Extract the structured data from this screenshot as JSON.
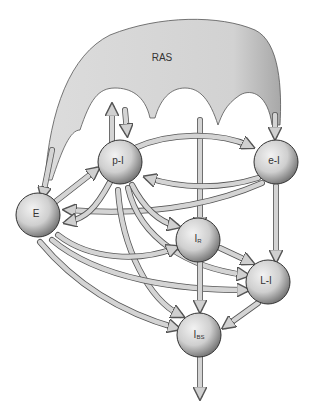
{
  "diagram": {
    "type": "network",
    "colors": {
      "fill": "#d6d6d6",
      "stroke": "#555555",
      "shade": "#8a8a8a",
      "background": "#ffffff"
    },
    "nodes": [
      {
        "id": "ras",
        "label": "RAS",
        "shape": "arch-blob"
      },
      {
        "id": "pI",
        "label": "p-I",
        "shape": "sphere"
      },
      {
        "id": "eI",
        "label": "e-I",
        "shape": "sphere"
      },
      {
        "id": "E",
        "label": "E",
        "shape": "sphere"
      },
      {
        "id": "IR",
        "label": "I",
        "sub": "R",
        "shape": "sphere"
      },
      {
        "id": "LI",
        "label": "L-I",
        "shape": "sphere"
      },
      {
        "id": "IBS",
        "label": "I",
        "sub": "BS",
        "shape": "sphere"
      }
    ],
    "edges": [
      {
        "from": "ras",
        "to": "E"
      },
      {
        "from": "ras",
        "to": "pI"
      },
      {
        "from": "ras",
        "to": "IR"
      },
      {
        "from": "ras",
        "to": "eI"
      },
      {
        "from": "pI",
        "to": "up-output"
      },
      {
        "from": "pI",
        "to": "eI"
      },
      {
        "from": "eI",
        "to": "pI"
      },
      {
        "from": "eI",
        "to": "E"
      },
      {
        "from": "eI",
        "to": "LI"
      },
      {
        "from": "E",
        "to": "pI"
      },
      {
        "from": "pI",
        "to": "E"
      },
      {
        "from": "pI",
        "to": "IR"
      },
      {
        "from": "pI",
        "to": "LI"
      },
      {
        "from": "pI",
        "to": "IBS"
      },
      {
        "from": "E",
        "to": "IR"
      },
      {
        "from": "E",
        "to": "LI"
      },
      {
        "from": "E",
        "to": "IBS"
      },
      {
        "from": "IR",
        "to": "LI"
      },
      {
        "from": "IR",
        "to": "IBS"
      },
      {
        "from": "LI",
        "to": "IBS"
      },
      {
        "from": "IBS",
        "to": "down-output"
      }
    ]
  }
}
